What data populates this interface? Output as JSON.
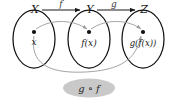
{
  "figure": {
    "sets": [
      {
        "name": "X",
        "label": "X",
        "element_label": "x"
      },
      {
        "name": "Y",
        "label": "Y",
        "element_label": "f(x)"
      },
      {
        "name": "Z",
        "label": "Z",
        "element_label": "g(f(x))"
      }
    ],
    "maps": [
      {
        "name": "f",
        "label": "f",
        "from": "X",
        "to": "Y"
      },
      {
        "name": "g",
        "label": "g",
        "from": "Y",
        "to": "Z"
      }
    ],
    "composition": {
      "label": "g ∘ f",
      "from": "X",
      "to": "Z"
    },
    "colors": {
      "ink": "#1a1a1a",
      "ellipse_stroke": "#111111",
      "inner_arrow": "#9a9a9a",
      "composition_fill": "#c9c9c9",
      "background": "#ffffff"
    }
  }
}
